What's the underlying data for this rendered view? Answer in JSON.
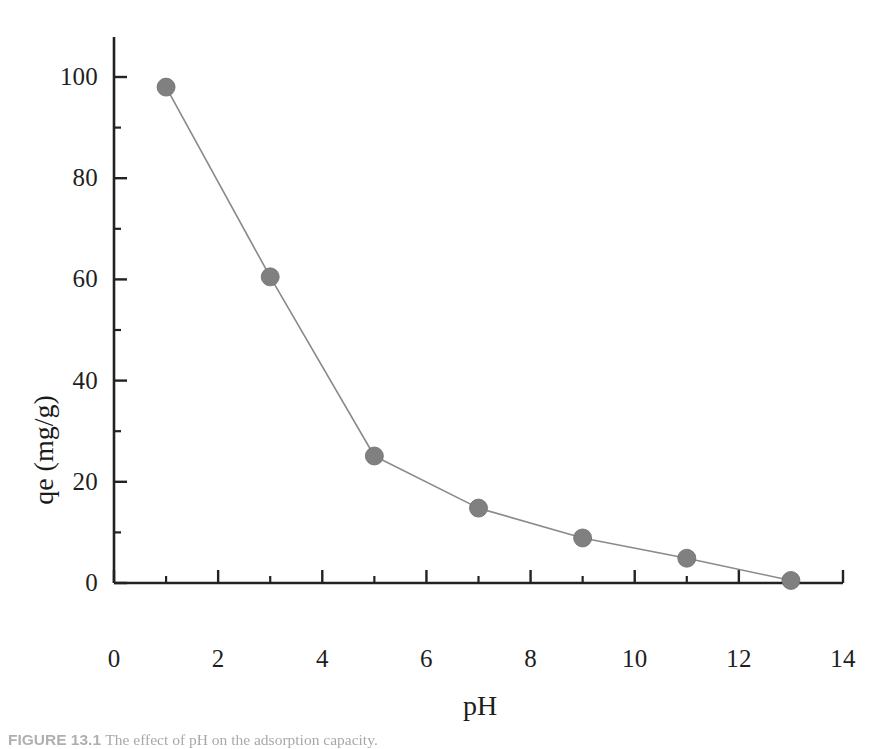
{
  "figure": {
    "caption_label": "FIGURE 13.1",
    "caption_text": "The effect of pH on the adsorption capacity."
  },
  "chart_data": {
    "type": "line",
    "title": "",
    "subtitle": "",
    "xlabel": "pH",
    "ylabel": "qe (mg/g)",
    "xlim": [
      0,
      14
    ],
    "ylim": [
      0,
      100
    ],
    "xticks": [
      0,
      2,
      4,
      6,
      8,
      10,
      12,
      14
    ],
    "xtick_labels": [
      "0",
      "2",
      "4",
      "6",
      "8",
      "10",
      "12",
      "14"
    ],
    "yticks": [
      0,
      20,
      40,
      60,
      80,
      100
    ],
    "ytick_labels": [
      "0",
      "20",
      "40",
      "60",
      "80",
      "100"
    ],
    "x_minor_tick_interval": 1,
    "y_minor_tick_interval": 10,
    "grid": false,
    "legend": false,
    "legend_position": "none",
    "marker": "circle",
    "marker_color": "#808080",
    "marker_size_px": 18,
    "line_color": "#8a8a8a",
    "line_width_px": 1.6,
    "axis_color": "#222222",
    "background": "#ffffff",
    "x": [
      1,
      3,
      5,
      7,
      9,
      11,
      13
    ],
    "values": [
      98.0,
      60.5,
      25.1,
      14.8,
      8.9,
      4.9,
      0.5
    ],
    "series": [
      {
        "name": "qe",
        "x": [
          1,
          3,
          5,
          7,
          9,
          11,
          13
        ],
        "values": [
          98.0,
          60.5,
          25.1,
          14.8,
          8.9,
          4.9,
          0.5
        ]
      }
    ]
  }
}
